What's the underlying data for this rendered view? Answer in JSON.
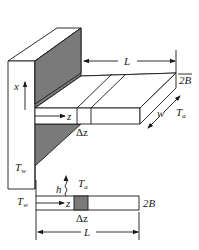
{
  "figure": {
    "type": "fin-heat-transfer-schematic",
    "iso_view": {
      "labels": {
        "x_axis": "x",
        "z_axis": "z",
        "delta_z": "Δz",
        "length": "L",
        "half_thickness": "2B",
        "width": "w",
        "ambient_temp": "T",
        "ambient_temp_sub": "a",
        "wall_temp": "T",
        "wall_temp_sub": "w"
      }
    },
    "side_view": {
      "labels": {
        "heat_coeff": "h",
        "ambient_temp": "T",
        "ambient_temp_sub": "a",
        "wall_temp": "T",
        "wall_temp_sub": "w",
        "z_axis": "z",
        "delta_z": "Δz",
        "thickness": "2B",
        "length": "L"
      }
    },
    "colors": {
      "line": "#1a1a1a",
      "shaded_wall": "#7a7a7a",
      "background": "#ffffff"
    }
  }
}
